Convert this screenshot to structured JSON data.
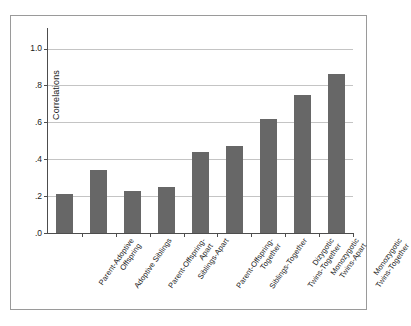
{
  "chart_data": {
    "type": "bar",
    "title": "",
    "subtitle": "",
    "xlabel": "",
    "ylabel": "Correlations",
    "ylim": [
      0.0,
      1.1
    ],
    "grid": true,
    "legend": false,
    "orientation": "vertical",
    "bar_color": "#676767",
    "gridline_color": "#c4c4c4",
    "axis_color": "#4d4d4d",
    "categories": [
      "Parent-Adoptive Offspring",
      "Adoptive Siblings",
      "Parent-Offspring-Apart",
      "Siblings-Apart",
      "Parent-Offspring-Together",
      "Siblings-Together",
      "Dizygotic Twins-Together",
      "Monozygotic Twins-Apart",
      "Monozygotic Twins-Together"
    ],
    "category_lines": [
      [
        "Parent-Adoptive",
        "Offspring"
      ],
      [
        "Adoptive Siblings"
      ],
      [
        "Parent-Offspring-",
        "Apart"
      ],
      [
        "Siblings-Apart"
      ],
      [
        "Parent-Offspring-",
        "Together"
      ],
      [
        "Siblings-Together"
      ],
      [
        "Dizygotic",
        "Twins-Together"
      ],
      [
        "Monozygotic",
        "Twins-Apart"
      ],
      [
        "Monozygotic",
        "Twins-Together"
      ]
    ],
    "values": [
      0.21,
      0.34,
      0.23,
      0.25,
      0.44,
      0.47,
      0.62,
      0.75,
      0.86
    ],
    "ytick_values": [
      0.0,
      0.2,
      0.4,
      0.6,
      0.8,
      1.0
    ],
    "ytick_labels": [
      ".0",
      ".2",
      ".4",
      ".6",
      ".8",
      "1.0"
    ]
  }
}
